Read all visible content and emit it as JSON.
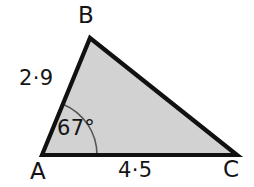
{
  "figure": {
    "kind": "labelled-triangle-diagram",
    "background_color": "#ffffff",
    "fill_color": "#d2d2d2",
    "edge_color": "#111111",
    "arc_color": "#555555",
    "text_color": "#141414",
    "vertices": {
      "a": {
        "label": "A",
        "x": 42,
        "y": 155
      },
      "b": {
        "label": "B",
        "x": 90,
        "y": 38
      },
      "c": {
        "label": "C",
        "x": 237,
        "y": 155
      }
    },
    "sides": [
      {
        "name": "ab",
        "label": "2·9",
        "value": 2.9,
        "from": "A",
        "to": "B"
      },
      {
        "name": "ac",
        "label": "4·5",
        "value": 4.5,
        "from": "A",
        "to": "C"
      }
    ],
    "angles": [
      {
        "name": "angle-a",
        "at": "A",
        "label": "67°",
        "value": 67,
        "unit": "degrees",
        "arc_radius": 55
      }
    ]
  }
}
